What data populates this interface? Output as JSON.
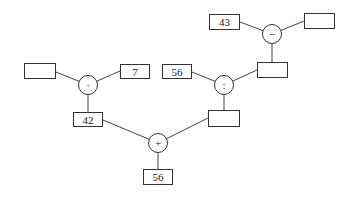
{
  "diagram": {
    "operators": {
      "multiply": "·",
      "divide": ":",
      "subtract": "−",
      "add": "+"
    },
    "boxes": {
      "mult_left": "",
      "mult_right": "7",
      "mult_result": "42",
      "div_left": "56",
      "div_right": "",
      "div_result": "",
      "sub_left": "43",
      "sub_right": "",
      "add_result": "56"
    }
  }
}
